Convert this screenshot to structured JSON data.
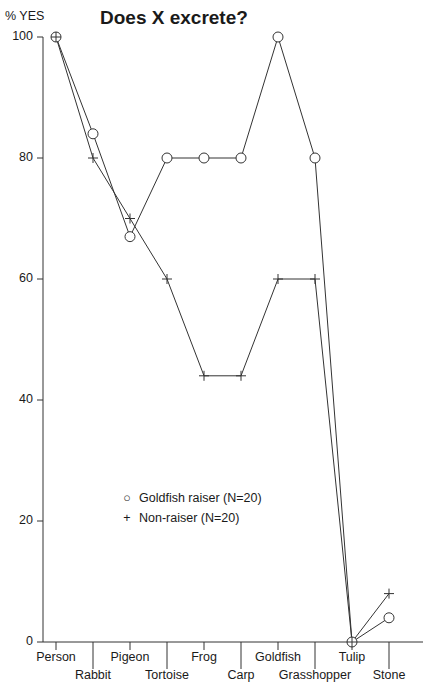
{
  "chart_data": {
    "type": "line",
    "title": "Does X excrete?",
    "xlabel": "",
    "ylabel": "% YES",
    "ylim": [
      0,
      100
    ],
    "yticks": [
      0,
      20,
      40,
      60,
      80,
      100
    ],
    "grid": false,
    "legend_position": "lower-left inside plot",
    "categories": [
      "Person",
      "Rabbit",
      "Pigeon",
      "Tortoise",
      "Frog",
      "Carp",
      "Goldfish",
      "Grasshopper",
      "Tulip",
      "Stone"
    ],
    "series": [
      {
        "name": "Goldfish raiser (N=20)",
        "marker": "circle",
        "values": [
          100,
          84,
          67,
          80,
          80,
          80,
          100,
          80,
          0,
          4
        ]
      },
      {
        "name": "Non-raiser (N=20)",
        "marker": "plus",
        "values": [
          100,
          80,
          70,
          60,
          44,
          44,
          60,
          60,
          0,
          8
        ]
      }
    ]
  },
  "labels": {
    "title": "Does X excrete?",
    "ylabel": "% YES",
    "yticks": [
      "0",
      "20",
      "40",
      "60",
      "80",
      "100"
    ],
    "xticks": [
      "Person",
      "Rabbit",
      "Pigeon",
      "Tortoise",
      "Frog",
      "Carp",
      "Goldfish",
      "Grasshopper",
      "Tulip",
      "Stone"
    ]
  },
  "legend": {
    "items": [
      {
        "symbol": "○",
        "label": "Goldfish raiser (N=20)"
      },
      {
        "symbol": "+",
        "label": "Non-raiser (N=20)"
      }
    ]
  },
  "colors": {
    "line": "#333333",
    "text": "#1a1a1a",
    "background": "#ffffff"
  }
}
